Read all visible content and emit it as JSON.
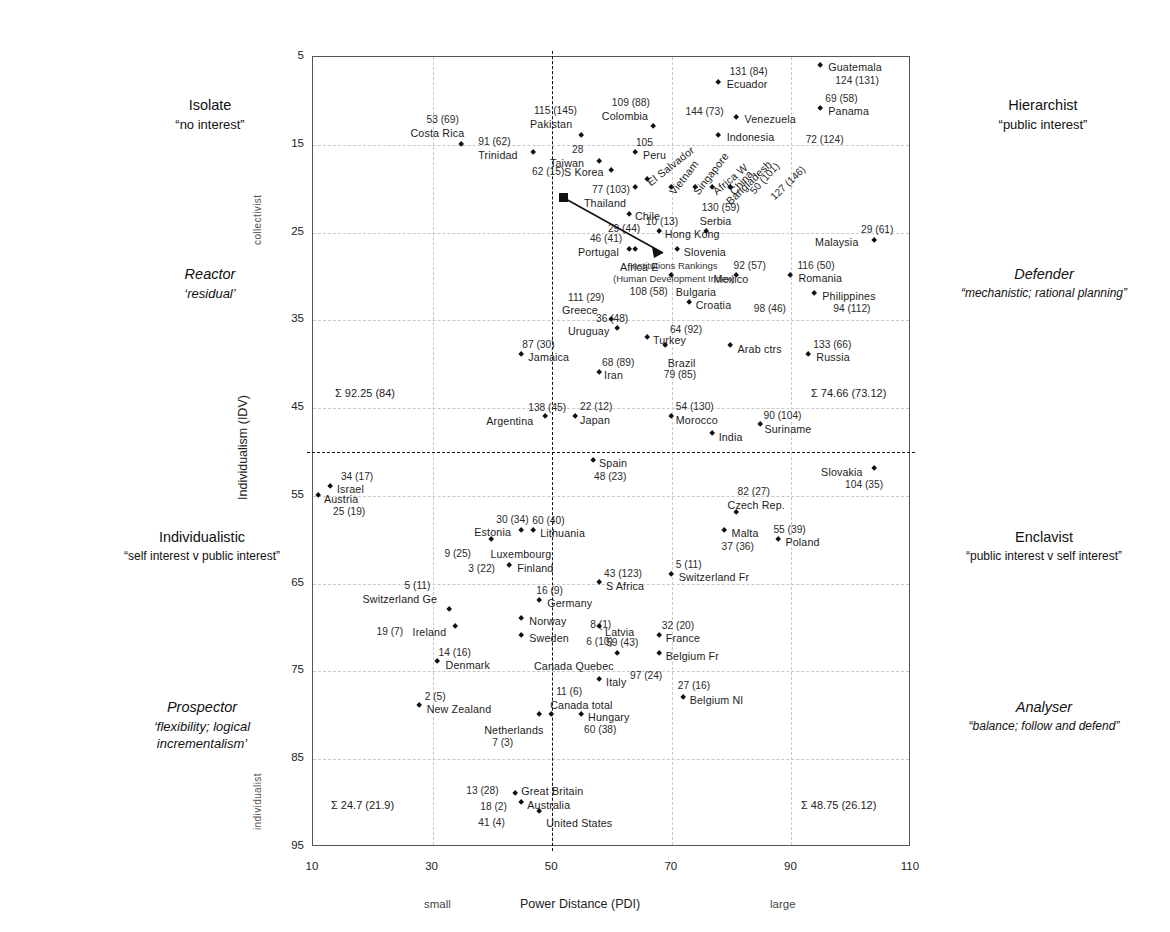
{
  "chart_data": {
    "type": "scatter",
    "title": "",
    "xlabel": "Power Distance (PDI)",
    "ylabel": "Individualism (IDV)",
    "xlim": [
      10,
      110
    ],
    "ylim": [
      5,
      95
    ],
    "y_inverted": true,
    "grid": true,
    "xticks": [
      "10",
      "30",
      "50",
      "70",
      "90",
      "110"
    ],
    "yticks": [
      "5",
      "15",
      "25",
      "35",
      "45",
      "55",
      "65",
      "75",
      "85",
      "95"
    ],
    "x_low_label": "small",
    "x_high_label": "large",
    "y_top_label": "collectivist",
    "y_bottom_label": "individualist",
    "quadrant_divider_x": 50,
    "quadrant_divider_y": 50,
    "points": [
      {
        "name": "Guatemala",
        "x": 95,
        "y": 6,
        "rank": "124 (131)"
      },
      {
        "name": "Ecuador",
        "x": 78,
        "y": 8,
        "rank": "131 (84)"
      },
      {
        "name": "Panama",
        "x": 95,
        "y": 11,
        "rank": "69 (58)"
      },
      {
        "name": "Venezuela",
        "x": 81,
        "y": 12,
        "rank": "144 (73)"
      },
      {
        "name": "Colombia",
        "x": 67,
        "y": 13,
        "rank": "109 (88)"
      },
      {
        "name": "Pakistan",
        "x": 55,
        "y": 14,
        "rank": "115 (145)"
      },
      {
        "name": "Indonesia",
        "x": 78,
        "y": 14,
        "rank": "72 (124)"
      },
      {
        "name": "Costa Rica",
        "x": 35,
        "y": 15,
        "rank": "53 (69)"
      },
      {
        "name": "Peru",
        "x": 64,
        "y": 16,
        "rank": "105"
      },
      {
        "name": "Trinidad",
        "x": 47,
        "y": 16,
        "rank": "91 (62)"
      },
      {
        "name": "Taiwan",
        "x": 58,
        "y": 17,
        "rank": "28"
      },
      {
        "name": "S Korea",
        "x": 60,
        "y": 18,
        "rank": "62 (15)"
      },
      {
        "name": "El Salvador",
        "x": 66,
        "y": 19,
        "rank": ""
      },
      {
        "name": "Vietnam",
        "x": 70,
        "y": 20,
        "rank": ""
      },
      {
        "name": "Singapore",
        "x": 74,
        "y": 20,
        "rank": ""
      },
      {
        "name": "Africa W",
        "x": 77,
        "y": 20,
        "rank": ""
      },
      {
        "name": "China",
        "x": 80,
        "y": 20,
        "rank": "50 (101)"
      },
      {
        "name": "Bangladesh",
        "x": 80,
        "y": 20,
        "rank": "127 (146)"
      },
      {
        "name": "Thailand",
        "x": 64,
        "y": 20,
        "rank": "77 (103)"
      },
      {
        "name": "Chile",
        "x": 63,
        "y": 23,
        "rank": "29 (44)"
      },
      {
        "name": "Hong Kong",
        "x": 68,
        "y": 25,
        "rank": "10 (13)"
      },
      {
        "name": "Serbia",
        "x": 76,
        "y": 25,
        "rank": "130 (59)"
      },
      {
        "name": "Malaysia",
        "x": 104,
        "y": 26,
        "rank": "29 (61)"
      },
      {
        "name": "Portugal",
        "x": 63,
        "y": 27,
        "rank": "46 (41)"
      },
      {
        "name": "Africa E",
        "x": 64,
        "y": 27,
        "rank": ""
      },
      {
        "name": "Slovenia",
        "x": 71,
        "y": 27,
        "rank": ""
      },
      {
        "name": "Mexico",
        "x": 81,
        "y": 30,
        "rank": "92 (57)"
      },
      {
        "name": "Romania",
        "x": 90,
        "y": 30,
        "rank": "116 (50)"
      },
      {
        "name": "Bulgaria",
        "x": 70,
        "y": 30,
        "rank": "108 (58)"
      },
      {
        "name": "Philippines",
        "x": 94,
        "y": 32,
        "rank": "94 (112)"
      },
      {
        "name": "Uruguay",
        "x": 61,
        "y": 36,
        "rank": "36 (48)"
      },
      {
        "name": "Croatia",
        "x": 73,
        "y": 33,
        "rank": "98 (46)"
      },
      {
        "name": "Greece",
        "x": 60,
        "y": 35,
        "rank": "111 (29)"
      },
      {
        "name": "Turkey",
        "x": 66,
        "y": 37,
        "rank": "64 (92)"
      },
      {
        "name": "Brazil",
        "x": 69,
        "y": 38,
        "rank": "79 (85)"
      },
      {
        "name": "Arab ctrs",
        "x": 80,
        "y": 38,
        "rank": ""
      },
      {
        "name": "Russia",
        "x": 93,
        "y": 39,
        "rank": "133 (66)"
      },
      {
        "name": "Jamaica",
        "x": 45,
        "y": 39,
        "rank": "87 (30)"
      },
      {
        "name": "Iran",
        "x": 58,
        "y": 41,
        "rank": "68 (89)"
      },
      {
        "name": "Argentina",
        "x": 49,
        "y": 46,
        "rank": "138 (45)"
      },
      {
        "name": "Japan",
        "x": 54,
        "y": 46,
        "rank": "22 (12)"
      },
      {
        "name": "Morocco",
        "x": 70,
        "y": 46,
        "rank": "54 (130)"
      },
      {
        "name": "India",
        "x": 77,
        "y": 48,
        "rank": ""
      },
      {
        "name": "Suriname",
        "x": 85,
        "y": 47,
        "rank": "90 (104)"
      },
      {
        "name": "Spain",
        "x": 57,
        "y": 51,
        "rank": "48 (23)"
      },
      {
        "name": "Slovakia",
        "x": 104,
        "y": 52,
        "rank": "104 (35)"
      },
      {
        "name": "Israel",
        "x": 13,
        "y": 54,
        "rank": "34 (17)"
      },
      {
        "name": "Austria",
        "x": 11,
        "y": 55,
        "rank": "25 (19)"
      },
      {
        "name": "Czech Rep.",
        "x": 81,
        "y": 57,
        "rank": "82 (27)"
      },
      {
        "name": "Malta",
        "x": 79,
        "y": 59,
        "rank": "37 (36)"
      },
      {
        "name": "Estonia",
        "x": 45,
        "y": 59,
        "rank": "30 (34)"
      },
      {
        "name": "Lithuania",
        "x": 47,
        "y": 59,
        "rank": "60 (40)"
      },
      {
        "name": "Luxembourg",
        "x": 40,
        "y": 60,
        "rank": "9 (25)"
      },
      {
        "name": "Poland",
        "x": 88,
        "y": 60,
        "rank": "55 (39)"
      },
      {
        "name": "Finland",
        "x": 43,
        "y": 63,
        "rank": "3 (22)"
      },
      {
        "name": "Switzerland Fr",
        "x": 70,
        "y": 64,
        "rank": "5 (11)"
      },
      {
        "name": "S Africa",
        "x": 58,
        "y": 65,
        "rank": "43 (123)"
      },
      {
        "name": "Germany",
        "x": 48,
        "y": 67,
        "rank": "16 (9)"
      },
      {
        "name": "Switzerland Ge",
        "x": 33,
        "y": 68,
        "rank": "5 (11)"
      },
      {
        "name": "Norway",
        "x": 45,
        "y": 69,
        "rank": "8 (1)"
      },
      {
        "name": "Latvia",
        "x": 58,
        "y": 70,
        "rank": "59 (43)"
      },
      {
        "name": "Ireland",
        "x": 34,
        "y": 70,
        "rank": "19 (7)"
      },
      {
        "name": "Sweden",
        "x": 45,
        "y": 71,
        "rank": "6 (10)"
      },
      {
        "name": "France",
        "x": 68,
        "y": 71,
        "rank": "32 (20)"
      },
      {
        "name": "Belgium Fr",
        "x": 68,
        "y": 73,
        "rank": ""
      },
      {
        "name": "Denmark",
        "x": 31,
        "y": 74,
        "rank": "14 (16)"
      },
      {
        "name": "Canada Quebec",
        "x": 61,
        "y": 73,
        "rank": "97 (24)"
      },
      {
        "name": "Italy",
        "x": 58,
        "y": 76,
        "rank": ""
      },
      {
        "name": "Belgium Nl",
        "x": 72,
        "y": 78,
        "rank": "27 (16)"
      },
      {
        "name": "New Zealand",
        "x": 28,
        "y": 79,
        "rank": "2 (5)"
      },
      {
        "name": "Canada total",
        "x": 50,
        "y": 80,
        "rank": "11 (6)"
      },
      {
        "name": "Netherlands",
        "x": 48,
        "y": 80,
        "rank": "7 (3)"
      },
      {
        "name": "Hungary",
        "x": 55,
        "y": 80,
        "rank": "60 (38)"
      },
      {
        "name": "Great Britain",
        "x": 44,
        "y": 89,
        "rank": "13 (28)"
      },
      {
        "name": "Australia",
        "x": 45,
        "y": 90,
        "rank": "18 (2)"
      },
      {
        "name": "United States",
        "x": 48,
        "y": 91,
        "rank": "41 (4)"
      }
    ],
    "quadrant_sums": [
      {
        "id": "top-left",
        "text": "Σ 92.25 (84)"
      },
      {
        "id": "top-right",
        "text": "Σ 74.66 (73.12)"
      },
      {
        "id": "bottom-left",
        "text": "Σ 24.7 (21.9)"
      },
      {
        "id": "bottom-right",
        "text": "Σ 48.75 (26.12)"
      }
    ],
    "annotation": {
      "line1": "Institutions Rankings",
      "line2": "(Human Development Index)"
    }
  },
  "quadrants": {
    "top_left": {
      "title": "Isolate",
      "subtitle": "“no interest”",
      "title2": "Reactor",
      "subtitle2": "‘residual’"
    },
    "top_right": {
      "title": "Hierarchist",
      "subtitle": "“public interest”",
      "title2": "Defender",
      "subtitle2": "“mechanistic; rational planning”"
    },
    "bottom_left": {
      "title": "Individualistic",
      "subtitle": "“self interest v public interest”",
      "title2": "Prospector",
      "subtitle2": "‘flexibility; logical incrementalism’"
    },
    "bottom_right": {
      "title": "Enclavist",
      "subtitle": "“public interest v self interest”",
      "title2": "Analyser",
      "subtitle2": "“balance; follow and defend”"
    }
  },
  "quad_text": {
    "isolate": "Isolate",
    "isolate_sub": "“no interest”",
    "reactor": "Reactor",
    "reactor_sub": "‘residual’",
    "hierarchist": "Hierarchist",
    "hierarchist_sub": "“public interest”",
    "defender": "Defender",
    "defender_sub": "“mechanistic; rational planning”",
    "individualistic": "Individualistic",
    "individualistic_sub": "“self interest v public interest”",
    "prospector": "Prospector",
    "prospector_sub1": "‘flexibility; logical",
    "prospector_sub2": "incrementalism’",
    "enclavist": "Enclavist",
    "enclavist_sub": "“public interest v self interest”",
    "analyser": "Analyser",
    "analyser_sub": "“balance; follow and defend”"
  }
}
